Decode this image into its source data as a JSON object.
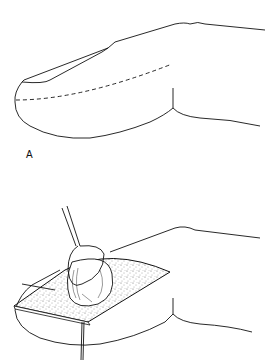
{
  "figure": {
    "panels": [
      {
        "id": "A",
        "label": "A",
        "description": "Finger lateral view with dashed incision line along the fingertip"
      },
      {
        "id": "B",
        "label": "",
        "description": "Open incision on fingertip with retractor hook lifting a mass; suture thread below"
      }
    ],
    "colors": {
      "stroke": "#111111",
      "background": "#ffffff",
      "stipple": "#555555"
    }
  }
}
